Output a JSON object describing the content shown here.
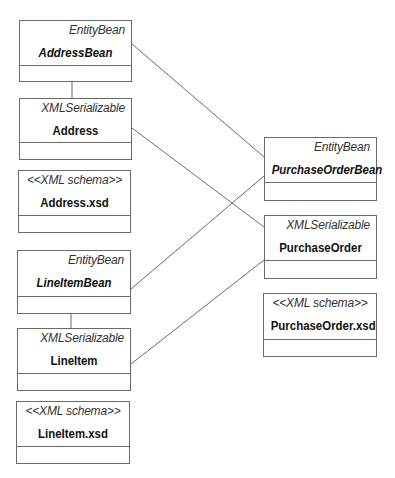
{
  "diagram": {
    "type": "uml-class-diagram",
    "classes": [
      {
        "id": "addressbean",
        "stereotype": "EntityBean",
        "name": "AddressBean",
        "italic": true,
        "box": {
          "x": 19,
          "y": 20,
          "w": 113,
          "h": 62,
          "divider": 45
        }
      },
      {
        "id": "address",
        "stereotype": "XMLSerializable",
        "name": "Address",
        "italic": false,
        "box": {
          "x": 19,
          "y": 98,
          "w": 113,
          "h": 62,
          "divider": 44
        }
      },
      {
        "id": "addressxsd",
        "stereotype": "<<XML schema>>",
        "name": "Address.xsd",
        "italic": false,
        "box": {
          "x": 18,
          "y": 170,
          "w": 113,
          "h": 63,
          "divider": 45
        }
      },
      {
        "id": "lineitembean",
        "stereotype": "EntityBean",
        "name": "LineItemBean",
        "italic": true,
        "box": {
          "x": 17,
          "y": 250,
          "w": 114,
          "h": 64,
          "divider": 46
        }
      },
      {
        "id": "lineitem",
        "stereotype": "XMLSerializable",
        "name": "LineItem",
        "italic": false,
        "box": {
          "x": 17,
          "y": 328,
          "w": 114,
          "h": 63,
          "divider": 45
        }
      },
      {
        "id": "lineitemxsd",
        "stereotype": "<<XML schema>>",
        "name": "LineItem.xsd",
        "italic": false,
        "box": {
          "x": 16,
          "y": 401,
          "w": 114,
          "h": 63,
          "divider": 45
        }
      },
      {
        "id": "purchaseorderbean",
        "stereotype": "EntityBean",
        "name": "PurchaseOrderBean",
        "italic": true,
        "box": {
          "x": 264,
          "y": 137,
          "w": 113,
          "h": 64,
          "divider": 45
        }
      },
      {
        "id": "purchaseorder",
        "stereotype": "XMLSerializable",
        "name": "PurchaseOrder",
        "italic": false,
        "box": {
          "x": 264,
          "y": 215,
          "w": 113,
          "h": 64,
          "divider": 45
        }
      },
      {
        "id": "purchaseorderxsd",
        "stereotype": "<<XML schema>>",
        "name": "PurchaseOrder.xsd",
        "italic": false,
        "box": {
          "x": 263,
          "y": 293,
          "w": 114,
          "h": 64,
          "divider": 46
        }
      }
    ],
    "connections": [
      {
        "from": "addressbean",
        "to": "address",
        "x1": 72,
        "y1": 82,
        "x2": 72,
        "y2": 98
      },
      {
        "from": "lineitembean",
        "to": "lineitem",
        "x1": 71,
        "y1": 314,
        "x2": 71,
        "y2": 328
      },
      {
        "from": "addressbean",
        "to": "purchaseorderbean",
        "x1": 132,
        "y1": 44,
        "x2": 264,
        "y2": 157
      },
      {
        "from": "address",
        "to": "purchaseorder",
        "x1": 132,
        "y1": 128,
        "x2": 264,
        "y2": 227
      },
      {
        "from": "lineitembean",
        "to": "purchaseorderbean",
        "x1": 131,
        "y1": 289,
        "x2": 264,
        "y2": 176
      },
      {
        "from": "lineitem",
        "to": "purchaseorder",
        "x1": 131,
        "y1": 364,
        "x2": 264,
        "y2": 260
      }
    ],
    "colors": {
      "line": "#6a6a6a",
      "text": "#111111",
      "stereotype": "#333333",
      "background": "#ffffff"
    }
  }
}
